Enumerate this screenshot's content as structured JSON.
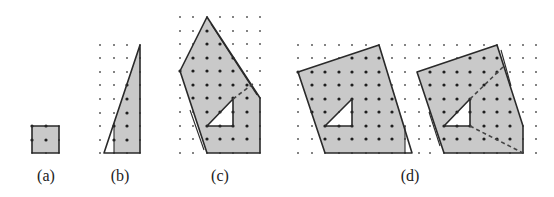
{
  "figure": {
    "colors": {
      "background": "#ffffff",
      "fill": "#c9c9c9",
      "stroke": "#2a2a2a",
      "dot_inside": "#1e1e1e",
      "dot_outside": "#5a5a5a",
      "hole": "#ffffff"
    },
    "panels": [
      {
        "id": "a",
        "label": "(a)",
        "label_x": 46,
        "grid": {
          "cols": [
            32,
            46,
            59
          ],
          "rows": [
            126,
            140,
            153
          ]
        },
        "fill_polygons": [
          [
            [
              32,
              126
            ],
            [
              59,
              126
            ],
            [
              59,
              153
            ],
            [
              32,
              153
            ]
          ]
        ],
        "holes": [],
        "outline_polygons": [
          [
            [
              32,
              126
            ],
            [
              59,
              126
            ],
            [
              59,
              153
            ],
            [
              32,
              153
            ]
          ]
        ],
        "extra_lines": [],
        "dashed_lines": []
      },
      {
        "id": "b",
        "label": "(b)",
        "label_x": 120,
        "grid": {
          "cols": [
            100,
            114,
            127,
            140
          ],
          "rows": [
            45,
            58,
            72,
            85,
            99,
            113,
            126,
            140,
            153
          ]
        },
        "fill_polygons": [
          [
            [
              140,
              45
            ],
            [
              114,
              123
            ],
            [
              114,
              153
            ],
            [
              140,
              153
            ]
          ]
        ],
        "holes": [],
        "outline_polygons": [
          [
            [
              140,
              45
            ],
            [
              104,
              153
            ],
            [
              140,
              153
            ]
          ]
        ],
        "extra_lines": [
          [
            [
              114,
              123
            ],
            [
              114,
              153
            ]
          ]
        ],
        "dashed_lines": []
      },
      {
        "id": "c",
        "label": "(c)",
        "label_x": 220,
        "grid": {
          "cols": [
            180,
            193,
            207,
            220,
            233,
            247,
            260
          ],
          "rows": [
            17,
            31,
            44,
            58,
            71,
            85,
            98,
            112,
            126,
            139,
            153
          ]
        },
        "fill_polygons": [
          [
            [
              207,
              17
            ],
            [
              260,
              98
            ],
            [
              260,
              153
            ],
            [
              207,
              153
            ],
            [
              180,
              71
            ]
          ]
        ],
        "holes": [
          [
            [
              207,
              126
            ],
            [
              233,
              126
            ],
            [
              233,
              99
            ]
          ]
        ],
        "outline_polygons": [
          [
            [
              207,
              17
            ],
            [
              260,
              98
            ],
            [
              260,
              153
            ],
            [
              207,
              153
            ],
            [
              180,
              71
            ]
          ],
          [
            [
              207,
              126
            ],
            [
              233,
              126
            ],
            [
              233,
              99
            ]
          ]
        ],
        "extra_lines": [
          [
            [
              211,
              24
            ],
            [
              257,
              95
            ]
          ],
          [
            [
              190,
              110
            ],
            [
              204,
              150
            ]
          ]
        ],
        "dashed_lines": [
          [
            [
              233,
              99
            ],
            [
              254,
              83
            ]
          ]
        ]
      },
      {
        "id": "d-left",
        "label": "",
        "label_x": 0,
        "grid": {
          "cols": [
            298,
            312,
            325,
            339,
            352,
            366,
            379,
            392,
            405,
            419
          ],
          "rows": [
            45,
            58,
            72,
            85,
            99,
            112,
            126,
            139,
            153
          ]
        },
        "fill_polygons": [
          [
            [
              379,
              45
            ],
            [
              298,
              72
            ],
            [
              325,
              153
            ],
            [
              405,
              153
            ],
            [
              405,
              127
            ]
          ]
        ],
        "holes": [
          [
            [
              325,
              126
            ],
            [
              352,
              126
            ],
            [
              352,
              99
            ]
          ]
        ],
        "outline_polygons": [
          [
            [
              379,
              45
            ],
            [
              298,
              72
            ],
            [
              325,
              153
            ],
            [
              412,
              153
            ]
          ],
          [
            [
              325,
              126
            ],
            [
              352,
              126
            ],
            [
              352,
              99
            ]
          ]
        ],
        "extra_lines": [
          [
            [
              405,
              126
            ],
            [
              405,
              153
            ]
          ]
        ],
        "dashed_lines": []
      },
      {
        "id": "d-right",
        "label": "(d)",
        "label_x": 410,
        "grid": {
          "cols": [
            430,
            444,
            457,
            470,
            484,
            497,
            510,
            523,
            536
          ],
          "rows": [
            45,
            58,
            72,
            85,
            99,
            112,
            126,
            139,
            153
          ]
        },
        "fill_polygons": [
          [
            [
              497,
              45
            ],
            [
              417,
              72
            ],
            [
              444,
              153
            ],
            [
              523,
              153
            ],
            [
              523,
              126
            ]
          ]
        ],
        "holes": [
          [
            [
              444,
              126
            ],
            [
              470,
              126
            ],
            [
              470,
              99
            ]
          ]
        ],
        "outline_polygons": [
          [
            [
              497,
              45
            ],
            [
              417,
              72
            ],
            [
              444,
              153
            ],
            [
              523,
              153
            ],
            [
              523,
              126
            ]
          ],
          [
            [
              444,
              126
            ],
            [
              470,
              126
            ],
            [
              470,
              99
            ]
          ]
        ],
        "extra_lines": [
          [
            [
              501,
              50
            ],
            [
              511,
              86
            ]
          ],
          [
            [
              429,
              112
            ],
            [
              440,
              146
            ]
          ]
        ],
        "dashed_lines": [
          [
            [
              470,
              99
            ],
            [
              504,
              66
            ]
          ],
          [
            [
              470,
              126
            ],
            [
              523,
              153
            ]
          ]
        ]
      }
    ]
  }
}
